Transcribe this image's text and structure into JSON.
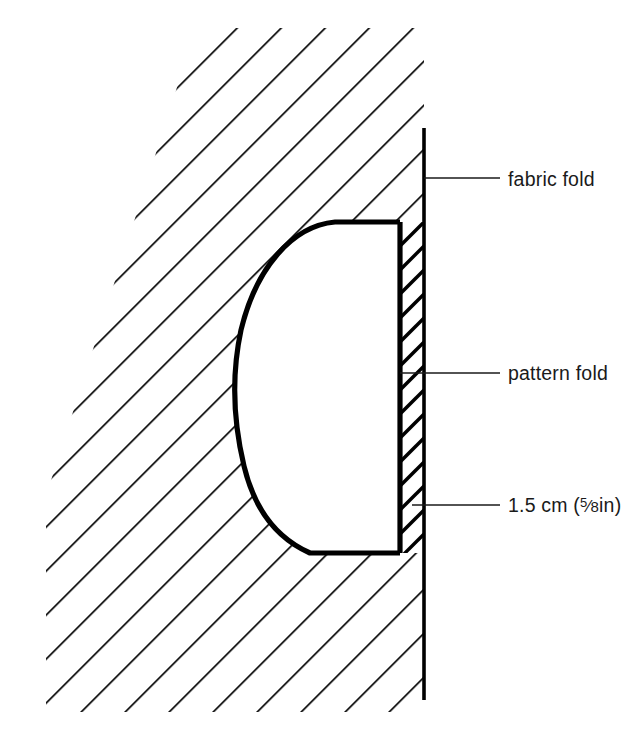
{
  "figure": {
    "type": "technical-sewing-diagram",
    "background_color": "#ffffff",
    "ink_color": "#000000",
    "hatch": {
      "angle_degrees": 45,
      "spacing_px": 22,
      "stroke_width_px": 3.2,
      "meaning": "fabric"
    },
    "pattern_piece": {
      "fill": "#ffffff",
      "outline_width_px": 5,
      "shape": "half-oval with straight right edge"
    },
    "seam_allowance_strip": {
      "meaning": "1.5 cm seam allowance between pattern fold and fabric fold",
      "hatched": true,
      "width_px": 24
    },
    "fabric_fold_line": {
      "x": 424,
      "y_top": 128,
      "y_bottom": 700,
      "stroke_width_px": 3.4
    }
  },
  "labels": [
    {
      "id": "fabric-fold",
      "text": "fabric fold",
      "leader": {
        "x1": 424,
        "x2": 500,
        "y": 178
      }
    },
    {
      "id": "pattern-fold",
      "text": "pattern fold",
      "leader": {
        "x1": 402,
        "x2": 500,
        "y": 373
      }
    },
    {
      "id": "seam-allowance",
      "text_prefix": "1.5 cm (",
      "fraction_numerator": "5",
      "fraction_solidus": "⁄",
      "fraction_denominator": "8",
      "text_unit": "in",
      "text_suffix": ")",
      "full_text": "1.5 cm (5⁄8in)",
      "leader": {
        "x1": 414,
        "x2": 500,
        "y": 505
      }
    }
  ]
}
